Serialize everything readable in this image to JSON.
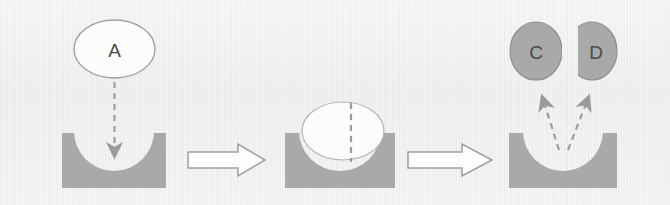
{
  "figure": {
    "background_color": "#f4f4f2",
    "shape_fill_gray": "#a9a9a9",
    "shape_stroke_gray": "#8a8a8a",
    "white_fill": "#fcfcfb",
    "dash_color": "#9a9a9a",
    "label_color": "#4a4a4a"
  },
  "stages": [
    {
      "id": "stage-1",
      "name": "substrate-approach",
      "molecule_label": "A",
      "molecule_shape": "ellipse",
      "molecule_fill": "white",
      "substrate_block": "concave-well",
      "motion": "downward-dashed-arrow"
    },
    {
      "id": "stage-2",
      "name": "substrate-bound",
      "molecule_label": "",
      "molecule_shape": "circle",
      "molecule_fill": "white",
      "substrate_block": "concave-well",
      "motion": "bisecting-dashed-line"
    },
    {
      "id": "stage-3",
      "name": "products-released",
      "product_labels": [
        "C",
        "D"
      ],
      "product_shape": "half-circle-pair",
      "product_fill": "gray",
      "substrate_block": "concave-well",
      "motion": "two-diverging-dashed-arrows"
    }
  ],
  "transitions": [
    {
      "id": "transition-1",
      "symbol": "block-arrow-right",
      "label": ""
    },
    {
      "id": "transition-2",
      "symbol": "block-arrow-right",
      "label": ""
    }
  ],
  "labels": {
    "reactant_a": "A",
    "product_c": "C",
    "product_d": "D"
  }
}
